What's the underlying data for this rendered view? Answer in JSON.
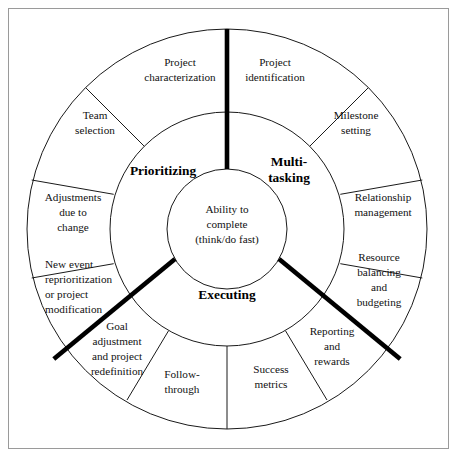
{
  "figure": {
    "type": "concentric-wheel-diagram",
    "core": {
      "lines": [
        "Ability to",
        "complete",
        "(think/do fast)"
      ]
    },
    "sectors": [
      {
        "id": "multi-tasking",
        "label": "Multi-",
        "label2": "tasking",
        "lines": [
          "Multi-",
          "tasking"
        ]
      },
      {
        "id": "prioritizing",
        "label": "Prioritizing",
        "lines": [
          "Prioritizing"
        ]
      },
      {
        "id": "executing",
        "label": "Executing",
        "lines": [
          "Executing"
        ]
      }
    ],
    "outer_segments": [
      {
        "id": "project-characterization",
        "lines": [
          "Project",
          "characterization"
        ],
        "align": "center"
      },
      {
        "id": "project-identification",
        "lines": [
          "Project",
          "identification"
        ],
        "align": "center"
      },
      {
        "id": "milestone-setting",
        "lines": [
          "Milestone",
          "setting"
        ],
        "align": "center"
      },
      {
        "id": "relationship-management",
        "lines": [
          "Relationship",
          "management"
        ],
        "align": "center"
      },
      {
        "id": "resource-balancing-and-budgeting",
        "lines": [
          "Resource",
          "balancing",
          "and",
          "budgeting"
        ],
        "align": "center"
      },
      {
        "id": "reporting-and-rewards",
        "lines": [
          "Reporting",
          "and",
          "rewards"
        ],
        "align": "center"
      },
      {
        "id": "success-metrics",
        "lines": [
          "Success",
          "metrics"
        ],
        "align": "center"
      },
      {
        "id": "follow-through",
        "lines": [
          "Follow-",
          "through"
        ],
        "align": "center"
      },
      {
        "id": "goal-adjustment-and-project-redefinition",
        "lines": [
          "Goal",
          "adjustment",
          "and project",
          "redefinition"
        ],
        "align": "center"
      },
      {
        "id": "new-event-reprioritization-or-project-modification",
        "lines": [
          "New event",
          "reprioritization",
          "or project",
          "modification"
        ],
        "align": "left"
      },
      {
        "id": "adjustments-due-to-change",
        "lines": [
          "Adjustments",
          "due to",
          "change"
        ],
        "align": "center"
      },
      {
        "id": "team-selection",
        "lines": [
          "Team",
          "selection"
        ],
        "align": "center"
      }
    ],
    "colors": {
      "stroke": "#1a1a1a",
      "thick_stroke": "#000000",
      "frame": "#9a9a9a",
      "background": "#ffffff",
      "text": "#111111"
    }
  }
}
